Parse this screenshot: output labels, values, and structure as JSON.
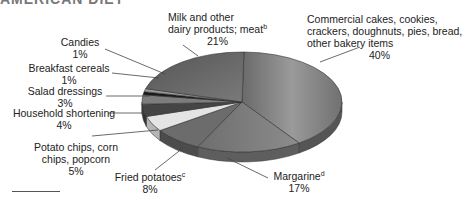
{
  "header": {
    "title": "AMERICAN DIET"
  },
  "chart_data": {
    "type": "pie",
    "title": "AMERICAN DIET",
    "style": "3d",
    "slices": [
      {
        "label": "Commercial cakes, cookies, crackers, doughnuts, pies, bread, other bakery items",
        "value": 40
      },
      {
        "label": "Margarine",
        "footnote": "d",
        "value": 17
      },
      {
        "label": "Fried potatoes",
        "footnote": "c",
        "value": 8
      },
      {
        "label": "Potato chips, corn chips, popcorn",
        "value": 5
      },
      {
        "label": "Household shortening",
        "value": 4
      },
      {
        "label": "Salad dressings",
        "value": 3
      },
      {
        "label": "Breakfast cereals",
        "value": 1
      },
      {
        "label": "Candies",
        "value": 1
      },
      {
        "label": "Milk and other dairy products; meat",
        "footnote": "b",
        "value": 21
      }
    ],
    "unit": "%"
  },
  "labels": {
    "bakery": {
      "l1": "Commercial cakes, cookies,",
      "l2": "crackers, doughnuts, pies, bread,",
      "l3": "other bakery items",
      "pct": "40%"
    },
    "margarine": {
      "name": "Margarine",
      "fn": "d",
      "pct": "17%"
    },
    "fried": {
      "name": "Fried potatoes",
      "fn": "c",
      "pct": "8%"
    },
    "chips": {
      "l1": "Potato chips, corn",
      "l2": "chips, popcorn",
      "pct": "5%"
    },
    "shortening": {
      "name": "Household shortening",
      "pct": "4%"
    },
    "salad": {
      "name": "Salad dressings",
      "pct": "3%"
    },
    "cereals": {
      "name": "Breakfast cereals",
      "pct": "1%"
    },
    "candies": {
      "name": "Candies",
      "pct": "1%"
    },
    "dairy": {
      "l1": "Milk and other",
      "l2": "dairy products; meat",
      "fn": "b",
      "pct": "21%"
    }
  }
}
